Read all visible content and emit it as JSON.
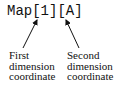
{
  "diagram": {
    "expression": "Map[1][A]",
    "labels": [
      {
        "lines": [
          "First",
          "dimension",
          "coordinate"
        ],
        "points_to": "[1]"
      },
      {
        "lines": [
          "Second",
          "dimension",
          "coordinate"
        ],
        "points_to": "[A]"
      }
    ]
  }
}
